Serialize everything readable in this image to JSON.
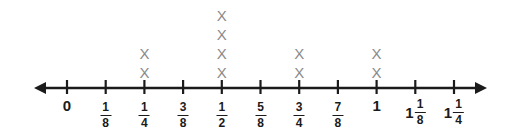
{
  "figure": {
    "kind": "line-plot-dot-plot-over-number-line",
    "background_color": "#ffffff",
    "axis_color": "#1b1b1b",
    "mark_color": "#8a8a8a",
    "mark_glyph": "X"
  },
  "chart_data": {
    "type": "scatter",
    "title": "",
    "subtitle": "",
    "xlabel": "",
    "ylabel": "",
    "grid": false,
    "legend": null,
    "axis": {
      "left_arrow": true,
      "right_arrow": true,
      "xlim": [
        0,
        1.25
      ],
      "tick_step": 0.125
    },
    "categories": [
      "0",
      "1/8",
      "1/4",
      "3/8",
      "1/2",
      "5/8",
      "3/4",
      "7/8",
      "1",
      "1 1/8",
      "1 1/4"
    ],
    "values": [
      0,
      0,
      2,
      0,
      4,
      0,
      2,
      0,
      2,
      0,
      0
    ],
    "ticks": [
      {
        "index": 0,
        "value": 0,
        "whole": "0",
        "numerator": "",
        "denominator": "",
        "marks": 0
      },
      {
        "index": 1,
        "value": 0.125,
        "whole": "",
        "numerator": "1",
        "denominator": "8",
        "marks": 0
      },
      {
        "index": 2,
        "value": 0.25,
        "whole": "",
        "numerator": "1",
        "denominator": "4",
        "marks": 2
      },
      {
        "index": 3,
        "value": 0.375,
        "whole": "",
        "numerator": "3",
        "denominator": "8",
        "marks": 0
      },
      {
        "index": 4,
        "value": 0.5,
        "whole": "",
        "numerator": "1",
        "denominator": "2",
        "marks": 4
      },
      {
        "index": 5,
        "value": 0.625,
        "whole": "",
        "numerator": "5",
        "denominator": "8",
        "marks": 0
      },
      {
        "index": 6,
        "value": 0.75,
        "whole": "",
        "numerator": "3",
        "denominator": "4",
        "marks": 2
      },
      {
        "index": 7,
        "value": 0.875,
        "whole": "",
        "numerator": "7",
        "denominator": "8",
        "marks": 0
      },
      {
        "index": 8,
        "value": 1,
        "whole": "1",
        "numerator": "",
        "denominator": "",
        "marks": 2
      },
      {
        "index": 9,
        "value": 1.125,
        "whole": "1",
        "numerator": "1",
        "denominator": "8",
        "marks": 0
      },
      {
        "index": 10,
        "value": 1.25,
        "whole": "1",
        "numerator": "1",
        "denominator": "4",
        "marks": 0
      }
    ]
  },
  "geometry": {
    "width": 521,
    "height": 133,
    "line_y": 88,
    "first_tick_x": 67,
    "tick_spacing": 38.7,
    "tick_half_height": 8,
    "arrow_left_tip_x": 34,
    "arrow_right_tip_x": 487,
    "label_top_y": 98,
    "mark_bottom_y": 72,
    "mark_spacing_y": 19
  }
}
